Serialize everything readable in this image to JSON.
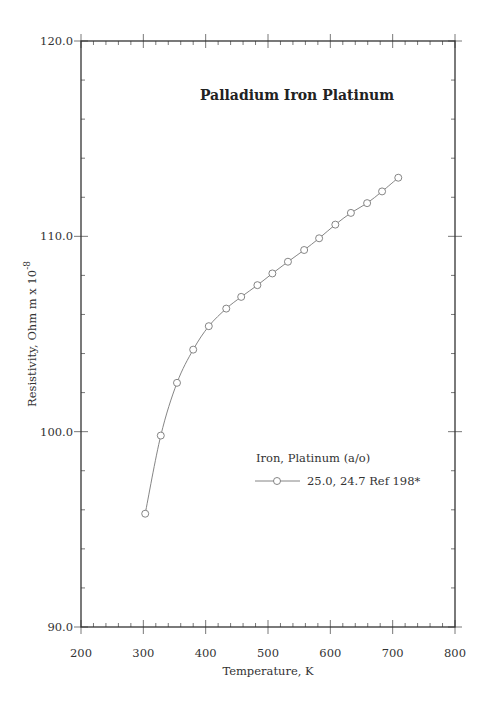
{
  "chart_data": {
    "type": "line",
    "title": "Palladium Iron Platinum",
    "xlabel": "Temperature, K",
    "ylabel": "Resistivity, Ohm m x 10",
    "ylabel_superscript": "-8",
    "xlim": [
      200,
      800
    ],
    "ylim": [
      90.0,
      120.0
    ],
    "x_ticks": [
      200,
      300,
      400,
      500,
      600,
      700,
      800
    ],
    "x_tick_labels": [
      "200",
      "300",
      "400",
      "500",
      "600",
      "700",
      "800"
    ],
    "y_ticks": [
      90.0,
      100.0,
      110.0,
      120.0
    ],
    "y_tick_labels": [
      "90.0",
      "100.0",
      "110.0",
      "120.0"
    ],
    "x_minor_step": 20,
    "y_minor_step": 2,
    "grid": false,
    "legend": {
      "title": "Iron, Platinum (a/o)",
      "position": "center-right",
      "entries": [
        "25.0, 24.7 Ref 198*"
      ]
    },
    "series": [
      {
        "name": "25.0, 24.7 Ref 198*",
        "marker": "open-circle",
        "color": "#777777",
        "x": [
          303,
          328,
          354,
          380,
          405,
          433,
          457,
          483,
          507,
          532,
          558,
          582,
          608,
          633,
          659,
          683,
          709
        ],
        "y": [
          95.8,
          99.8,
          102.5,
          104.2,
          105.4,
          106.3,
          106.9,
          107.5,
          108.1,
          108.7,
          109.3,
          109.9,
          110.6,
          111.2,
          111.7,
          112.3,
          113.0
        ]
      }
    ]
  }
}
